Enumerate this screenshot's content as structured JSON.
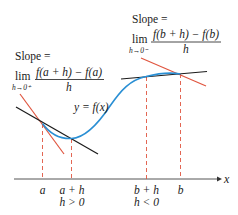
{
  "diagram": {
    "colors": {
      "curve": "#2a8fd4",
      "tangent": "#e0553f",
      "secant": "#1a1a1a",
      "guide": "#e0553f",
      "axis": "#555555",
      "text": "#1a1a1a"
    },
    "curve_label": "y = f(x)",
    "axis_label": "x",
    "left_annotation": {
      "slope_label": "Slope =",
      "lim": "lim",
      "lim_sub": "h→0⁺",
      "numerator": "f(a + h) − f(a)",
      "denominator": "h"
    },
    "right_annotation": {
      "slope_label": "Slope =",
      "lim": "lim",
      "lim_sub": "h→0⁻",
      "numerator": "f(b + h) − f(b)",
      "denominator": "h"
    },
    "ticks": [
      {
        "label": "a",
        "sub": ""
      },
      {
        "label": "a + h",
        "sub": "h > 0"
      },
      {
        "label": "b + h",
        "sub": "h < 0"
      },
      {
        "label": "b",
        "sub": ""
      }
    ]
  }
}
